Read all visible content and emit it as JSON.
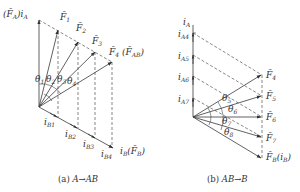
{
  "diagram_a": {
    "caption": "(a) A→AB",
    "caption_prefix": "(a) ",
    "caption_expr": "A→AB",
    "vertical_axis_label": {
      "prefix": "(F̄",
      "sub1": "A",
      "mid": ")i",
      "sub2": "A"
    },
    "horizontal_axis_label": {
      "pre": "i",
      "sub1": "B",
      "mid": "(F̄",
      "sub2": "B",
      "post": ")"
    },
    "vectors": [
      {
        "name": "F̄",
        "sub": "1"
      },
      {
        "name": "F̄",
        "sub": "2"
      },
      {
        "name": "F̄",
        "sub": "3"
      },
      {
        "name": "F̄",
        "sub": "4",
        "extra_pre": " (F̄",
        "extra_sub": "AB",
        "extra_post": ")"
      }
    ],
    "angles": [
      {
        "sym": "θ",
        "sub": "1"
      },
      {
        "sym": "θ",
        "sub": "2"
      },
      {
        "sym": "θ",
        "sub": "3"
      },
      {
        "sym": "θ",
        "sub": "4"
      }
    ],
    "currents": [
      {
        "sym": "i",
        "sub": "B1"
      },
      {
        "sym": "i",
        "sub": "B2"
      },
      {
        "sym": "i",
        "sub": "B3"
      },
      {
        "sym": "i",
        "sub": "B4"
      }
    ]
  },
  "diagram_b": {
    "caption_prefix": "(b) ",
    "caption_expr": "AB→B",
    "vertical_axis_label": {
      "sym": "i",
      "sub": "A"
    },
    "currents": [
      {
        "sym": "i",
        "sub": "A4"
      },
      {
        "sym": "i",
        "sub": "A5"
      },
      {
        "sym": "i",
        "sub": "A6"
      },
      {
        "sym": "i",
        "sub": "A7"
      }
    ],
    "vectors": [
      {
        "name": "F̄",
        "sub": "4"
      },
      {
        "name": "F̄",
        "sub": "5"
      },
      {
        "name": "F̄",
        "sub": "6"
      },
      {
        "name": "F̄",
        "sub": "7"
      },
      {
        "name": "F̄",
        "sub": "B",
        "extra_pre": "(i",
        "extra_sub": "B",
        "extra_post": ")"
      }
    ],
    "angles": [
      {
        "sym": "θ",
        "sub": "5"
      },
      {
        "sym": "θ",
        "sub": "6"
      },
      {
        "sym": "θ",
        "sub": "7"
      },
      {
        "sym": "θ",
        "sub": "8"
      }
    ]
  }
}
